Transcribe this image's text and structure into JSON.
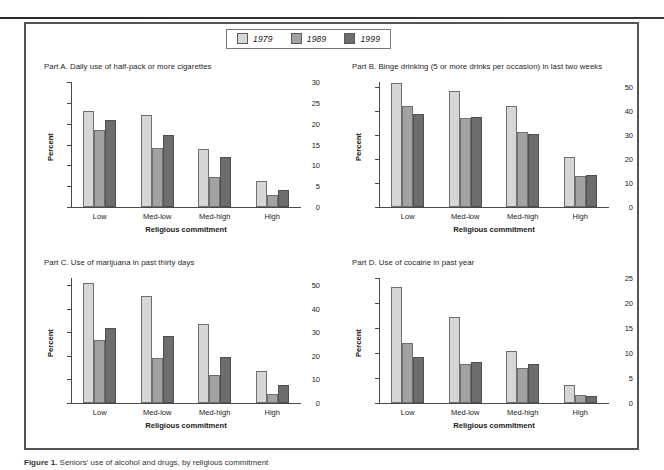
{
  "figure": {
    "caption_label": "Figure 1.",
    "caption_rest": " Seniors' use of alcohol and drugs, by religious commitment"
  },
  "legend": {
    "position": "top-center",
    "entries": [
      {
        "label": "1979",
        "color": "#d6d6d6"
      },
      {
        "label": "1989",
        "color": "#a2a2a2"
      },
      {
        "label": "1999",
        "color": "#6d6d6d"
      }
    ]
  },
  "axis_titles": {
    "x": "Religious commitment",
    "y": "Percent"
  },
  "categories": [
    "Low",
    "Med-low",
    "Med-high",
    "High"
  ],
  "chart_data": [
    {
      "type": "bar",
      "panel": "Part A.",
      "title": "Part A. Daily use of half-pack or more cigarettes",
      "title_text": "Daily use of half-pack or more cigarettes",
      "categories": [
        "Low",
        "Med-low",
        "Med-high",
        "High"
      ],
      "series": [
        {
          "name": "1979",
          "values": [
            23.0,
            22.0,
            14.0,
            6.3
          ]
        },
        {
          "name": "1989",
          "values": [
            18.5,
            14.2,
            7.2,
            3.0
          ]
        },
        {
          "name": "1999",
          "values": [
            20.8,
            17.2,
            11.9,
            4.1
          ]
        }
      ],
      "xlabel": "Religious commitment",
      "ylabel": "Percent",
      "ylim": [
        0,
        30
      ],
      "yticks": [
        0,
        5,
        10,
        15,
        20,
        25,
        30
      ],
      "grid": false,
      "legend_position": "figure top center"
    },
    {
      "type": "bar",
      "panel": "Part B.",
      "title": "Part B. Binge drinking (5 or more drinks per occasion) in last two weeks",
      "title_text": "Binge drinking (5 or more drinks per occasion) in last two weeks",
      "categories": [
        "Low",
        "Med-low",
        "Med-high",
        "High"
      ],
      "series": [
        {
          "name": "1979",
          "values": [
            51.5,
            48.2,
            42.0,
            20.7
          ]
        },
        {
          "name": "1989",
          "values": [
            42.0,
            37.0,
            31.0,
            12.8
          ]
        },
        {
          "name": "1999",
          "values": [
            38.7,
            37.4,
            30.3,
            13.3
          ]
        }
      ],
      "xlabel": "Religious commitment",
      "ylabel": "Percent",
      "ylim": [
        0,
        52
      ],
      "yticks": [
        0,
        10,
        20,
        30,
        40,
        50
      ],
      "grid": false,
      "legend_position": "figure top center"
    },
    {
      "type": "bar",
      "panel": "Part C.",
      "title": "Part C. Use of marijuana in past thirty days",
      "title_text": "Use of marijuana in past thirty days",
      "categories": [
        "Low",
        "Med-low",
        "Med-high",
        "High"
      ],
      "series": [
        {
          "name": "1979",
          "values": [
            51.0,
            45.5,
            33.3,
            13.5
          ]
        },
        {
          "name": "1989",
          "values": [
            26.8,
            19.0,
            12.0,
            3.8
          ]
        },
        {
          "name": "1999",
          "values": [
            31.6,
            28.6,
            19.4,
            7.6
          ]
        }
      ],
      "xlabel": "Religious commitment",
      "ylabel": "Percent",
      "ylim": [
        0,
        53
      ],
      "yticks": [
        0,
        10,
        20,
        30,
        40,
        50
      ],
      "grid": false,
      "legend_position": "figure top center"
    },
    {
      "type": "bar",
      "panel": "Part D.",
      "title": "Part D. Use of cocaine in past year",
      "title_text": "Use of cocaine in past year",
      "categories": [
        "Low",
        "Med-low",
        "Med-high",
        "High"
      ],
      "series": [
        {
          "name": "1979",
          "values": [
            23.3,
            17.3,
            10.4,
            3.6
          ]
        },
        {
          "name": "1989",
          "values": [
            12.1,
            7.9,
            7.1,
            1.6
          ]
        },
        {
          "name": "1999",
          "values": [
            9.2,
            8.2,
            7.8,
            1.4
          ]
        }
      ],
      "xlabel": "Religious commitment",
      "ylabel": "Percent",
      "ylim": [
        0,
        25
      ],
      "yticks": [
        0,
        5,
        10,
        15,
        20,
        25
      ],
      "grid": false,
      "legend_position": "figure top center"
    }
  ]
}
